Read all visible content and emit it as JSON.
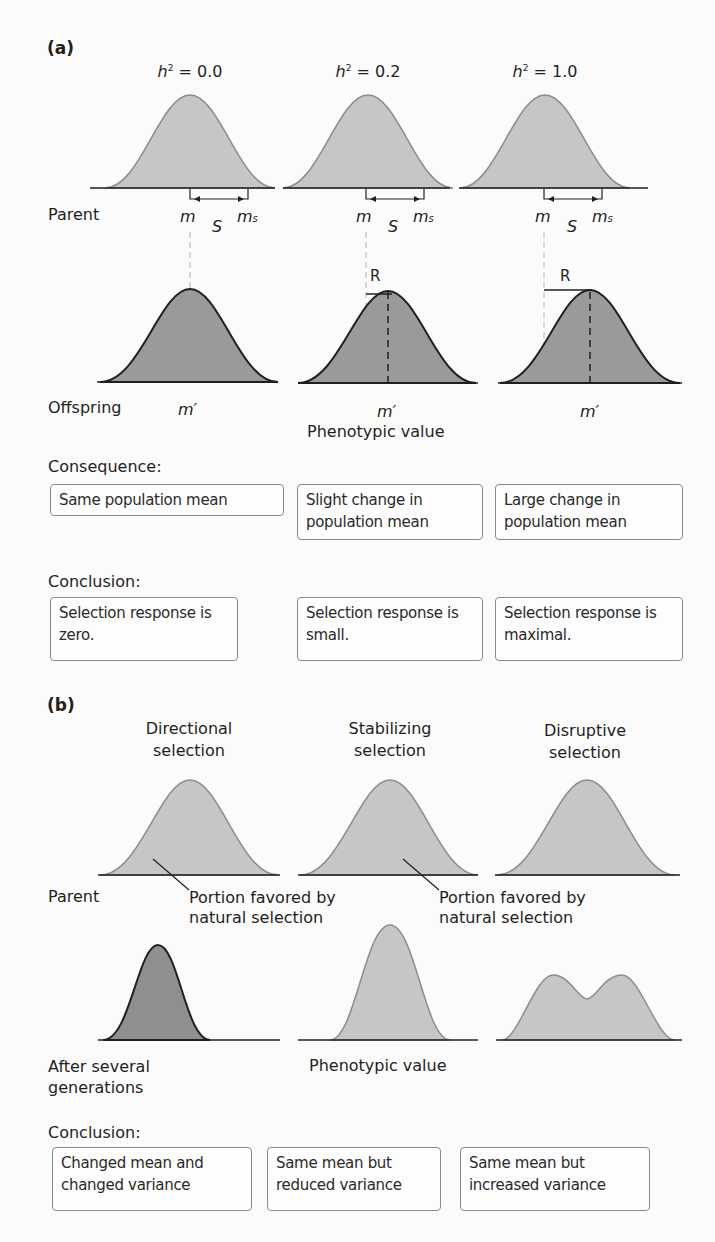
{
  "panel_a": {
    "label": "(a)",
    "columns": [
      {
        "h2_symbol": "h",
        "h2_exp": "2",
        "h2_value": "= 0.0",
        "m": "m",
        "S": "S",
        "ms": "m",
        "ms_sub": "s",
        "R": "",
        "m_prime": "m′"
      },
      {
        "h2_symbol": "h",
        "h2_exp": "2",
        "h2_value": "= 0.2",
        "m": "m",
        "S": "S",
        "ms": "m",
        "ms_sub": "s",
        "R": "R",
        "m_prime": "m′"
      },
      {
        "h2_symbol": "h",
        "h2_exp": "2",
        "h2_value": "= 1.0",
        "m": "m",
        "S": "S",
        "ms": "m",
        "ms_sub": "s",
        "R": "R",
        "m_prime": "m′"
      }
    ],
    "row_parent": "Parent",
    "row_offspring": "Offspring",
    "axis_label": "Phenotypic value",
    "consequence_heading": "Consequence:",
    "consequences": [
      "Same population mean",
      "Slight change in population mean",
      "Large change in population mean"
    ],
    "conclusion_heading": "Conclusion:",
    "conclusions": [
      "Selection response is zero.",
      "Selection response is small.",
      "Selection response is maximal."
    ]
  },
  "panel_b": {
    "label": "(b)",
    "titles": [
      {
        "line1": "Directional",
        "line2": "selection"
      },
      {
        "line1": "Stabilizing",
        "line2": "selection"
      },
      {
        "line1": "Disruptive",
        "line2": "selection"
      }
    ],
    "row_parent": "Parent",
    "annotations": [
      {
        "line1": "Portion favored by",
        "line2": "natural selection"
      },
      {
        "line1": "Portion favored by",
        "line2": "natural selection"
      }
    ],
    "row_after_line1": "After several",
    "row_after_line2": "generations",
    "axis_label": "Phenotypic value",
    "conclusion_heading": "Conclusion:",
    "conclusions": [
      "Changed mean and changed variance",
      "Same mean but reduced variance",
      "Same mean but increased variance"
    ]
  },
  "colors": {
    "parent_fill": "#c6c6c6",
    "parent_stroke": "#8c8c8c",
    "offspring_fill": "#9a9a9a",
    "offspring_stroke": "#231f20",
    "box_border": "#8a8a8a"
  }
}
